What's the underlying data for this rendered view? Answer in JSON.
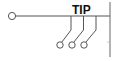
{
  "diagram": {
    "type": "switch-schematic",
    "label": "TIP",
    "colors": {
      "stroke": "#555555",
      "text": "#111111",
      "background": "#ffffff"
    },
    "input_terminal": {
      "shape": "circle"
    },
    "bus_line": "horizontal",
    "right_bar": "vertical",
    "switch_contacts": [
      {
        "id": 1,
        "terminal": "circle"
      },
      {
        "id": 2,
        "terminal": "circle"
      },
      {
        "id": 3,
        "terminal": "circle"
      }
    ]
  }
}
